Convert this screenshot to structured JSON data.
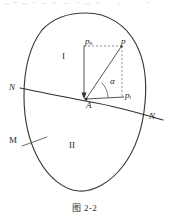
{
  "figure": {
    "caption": "图 2-2",
    "regions": {
      "upper_label": "I",
      "lower_label": "II"
    },
    "points": {
      "vertex_label": "A",
      "vector_tip_label": "p"
    },
    "components": {
      "normal_component": "p",
      "normal_component_sub": "n",
      "tangential_component": "p",
      "tangential_component_sub": "t"
    },
    "angle_label": "α",
    "interface_labels": {
      "left": "N",
      "right": "N",
      "medium": "M"
    },
    "colors": {
      "ink": "#262626",
      "curve": "#3a3a3a",
      "construction": "#6b6b6b",
      "background": "#ffffff"
    }
  }
}
